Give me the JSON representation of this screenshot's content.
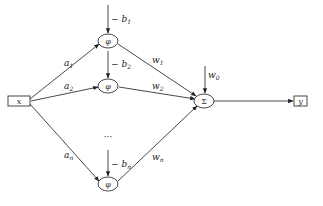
{
  "diagram": {
    "title": "",
    "input": {
      "label": "x"
    },
    "output": {
      "label": "y"
    },
    "activation_symbol": "φ",
    "sum_symbol": "Σ",
    "ellipsis": "···",
    "hidden_units": [
      {
        "id": "1",
        "input_weight": "a",
        "input_weight_sub": "1",
        "bias": "− b",
        "bias_sub": "1",
        "output_weight": "w",
        "output_weight_sub": "1"
      },
      {
        "id": "2",
        "input_weight": "a",
        "input_weight_sub": "2",
        "bias": "− b",
        "bias_sub": "2",
        "output_weight": "w",
        "output_weight_sub": "2"
      },
      {
        "id": "n",
        "input_weight": "a",
        "input_weight_sub": "n",
        "bias": "− b",
        "bias_sub": "n",
        "output_weight": "w",
        "output_weight_sub": "n"
      }
    ],
    "output_bias": {
      "label": "w",
      "sub": "0"
    }
  }
}
